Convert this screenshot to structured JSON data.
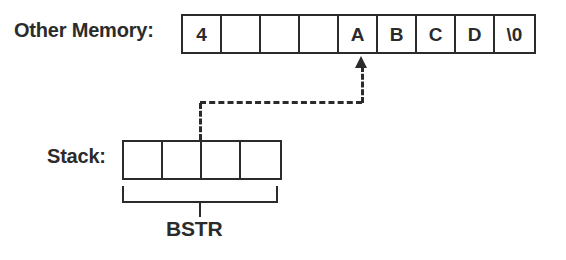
{
  "diagram": {
    "title_labels": {
      "other_memory": "Other Memory:",
      "stack": "Stack:",
      "bstr": "BSTR"
    },
    "colors": {
      "stroke": "#2b2b2b",
      "background": "#ffffff"
    },
    "other_memory_row": {
      "cell_count": 9,
      "cells": [
        {
          "value": "4"
        },
        {
          "value": ""
        },
        {
          "value": ""
        },
        {
          "value": ""
        },
        {
          "value": "A"
        },
        {
          "value": "B"
        },
        {
          "value": "C"
        },
        {
          "value": "D"
        },
        {
          "value": "\\0"
        }
      ]
    },
    "stack_row": {
      "cell_count": 4,
      "cells": [
        {
          "value": ""
        },
        {
          "value": ""
        },
        {
          "value": ""
        },
        {
          "value": ""
        }
      ]
    },
    "pointer": {
      "style": "dashed",
      "points_to_cell_index": 4,
      "points_to_cell_value": "A",
      "origin_cell_index": 2,
      "arrow_direction": "up"
    },
    "bracket": {
      "label": "BSTR",
      "spans_cells": [
        0,
        1,
        2,
        3
      ]
    }
  }
}
